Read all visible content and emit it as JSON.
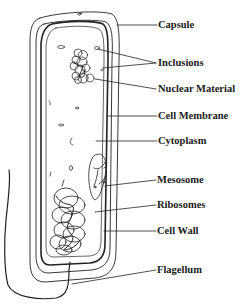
{
  "diagram": {
    "labels": [
      {
        "key": "capsule",
        "text": "Capsule",
        "x": 158,
        "y": 19
      },
      {
        "key": "inclusions",
        "text": "Inclusions",
        "x": 158,
        "y": 57
      },
      {
        "key": "nuclear_material",
        "text": "Nuclear Material",
        "x": 158,
        "y": 83
      },
      {
        "key": "cell_membrane",
        "text": "Cell Membrane",
        "x": 158,
        "y": 109
      },
      {
        "key": "cytoplasm",
        "text": "Cytoplasm",
        "x": 158,
        "y": 135
      },
      {
        "key": "mesosome",
        "text": "Mesosome",
        "x": 157,
        "y": 174
      },
      {
        "key": "ribosomes",
        "text": "Ribosomes",
        "x": 157,
        "y": 200
      },
      {
        "key": "cell_wall",
        "text": "Cell Wall",
        "x": 157,
        "y": 226
      },
      {
        "key": "flagellum",
        "text": "Flagellum",
        "x": 157,
        "y": 264
      }
    ],
    "colors": {
      "line": "#222222",
      "text": "#1a1a1a",
      "background": "#ffffff"
    }
  }
}
